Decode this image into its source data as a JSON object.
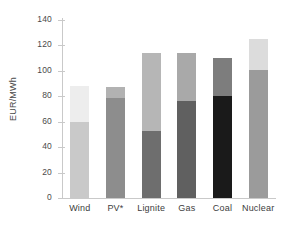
{
  "chart_data": {
    "type": "bar",
    "subtype": "stacked-range",
    "title": "",
    "subtitle": "",
    "xlabel": "",
    "ylabel": "EUR/MWh",
    "ylim": [
      0,
      140
    ],
    "ytick_values": [
      0,
      20,
      40,
      60,
      80,
      100,
      120,
      140
    ],
    "ytick_labels": [
      "0",
      "20",
      "40",
      "60",
      "80",
      "100",
      "120",
      "140"
    ],
    "grid": false,
    "legend": null,
    "categories": [
      "Wind",
      "PV*",
      "Lignite",
      "Gas",
      "Coal",
      "Nuclear"
    ],
    "series": [
      {
        "name": "lower",
        "values": [
          60,
          79,
          53,
          76,
          80,
          101
        ]
      },
      {
        "name": "upper",
        "values": [
          88,
          87,
          114,
          114,
          110,
          125
        ]
      }
    ],
    "bars": [
      {
        "category": "Wind",
        "low": 60,
        "high": 88,
        "lower_color": "#c9c9c9",
        "upper_color": "#ededed"
      },
      {
        "category": "PV*",
        "low": 79,
        "high": 87,
        "lower_color": "#8d8d8d",
        "upper_color": "#b2b2b2"
      },
      {
        "category": "Lignite",
        "low": 53,
        "high": 114,
        "lower_color": "#6e6e6e",
        "upper_color": "#b6b6b6"
      },
      {
        "category": "Gas",
        "low": 76,
        "high": 114,
        "lower_color": "#606060",
        "upper_color": "#a9a9a9"
      },
      {
        "category": "Coal",
        "low": 80,
        "high": 110,
        "lower_color": "#1a1a1a",
        "upper_color": "#7d7d7d"
      },
      {
        "category": "Nuclear",
        "low": 101,
        "high": 125,
        "lower_color": "#9b9b9b",
        "upper_color": "#dcdcdc"
      }
    ]
  },
  "axis": {
    "y_title": "EUR/MWh",
    "axis_color": "#c9c9c9"
  }
}
